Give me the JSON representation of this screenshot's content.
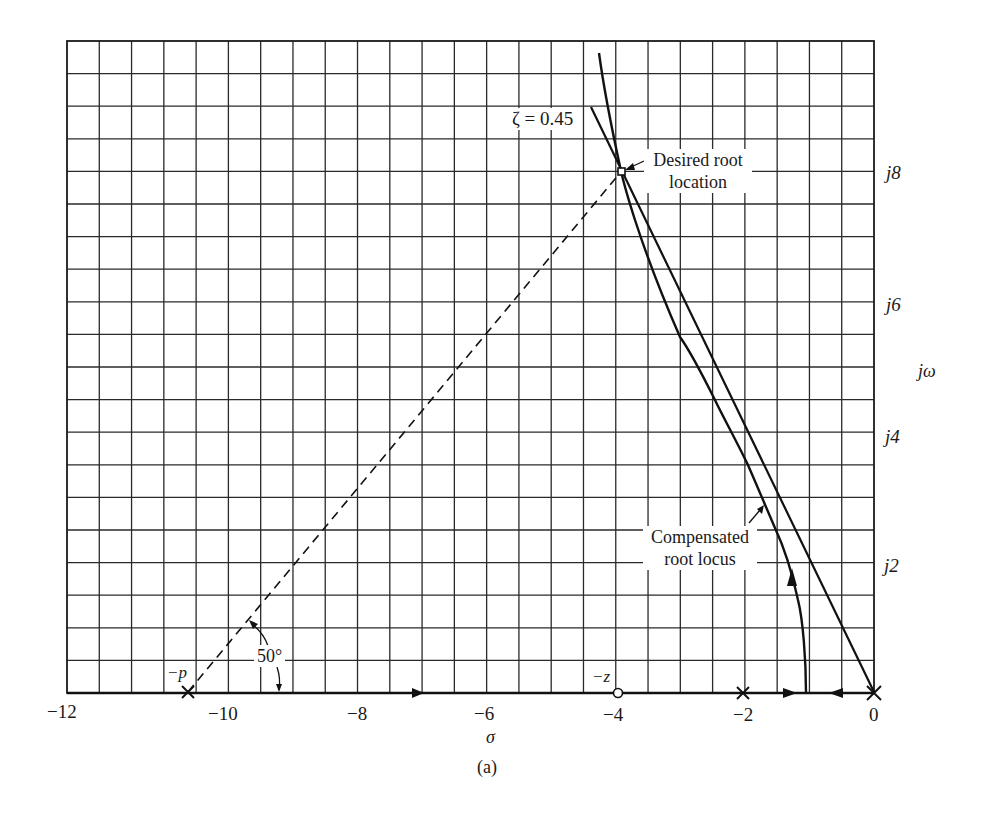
{
  "figure": {
    "caption": "(a)"
  },
  "chart_data": {
    "type": "line",
    "title": "",
    "subtitle": "",
    "caption": "(a)",
    "xlabel": "σ",
    "ylabel": "jω",
    "xlim": [
      -12.5,
      0
    ],
    "ylim": [
      0,
      10
    ],
    "grid": true,
    "grid_spacing": {
      "x": 0.5,
      "y": 0.5
    },
    "x_ticks": [
      "−12",
      "−10",
      "−8",
      "−6",
      "−4",
      "−2",
      "0"
    ],
    "x_tick_values": [
      -12,
      -10,
      -8,
      -6,
      -4,
      -2,
      0
    ],
    "y_ticks": [
      "j2",
      "j4",
      "j6",
      "j8"
    ],
    "y_tick_values": [
      2,
      4,
      6,
      8
    ],
    "series": [
      {
        "name": "Compensated root locus",
        "style": "solid",
        "points": [
          [
            -1.05,
            0
          ],
          [
            -1.15,
            0.95
          ],
          [
            -1.3,
            1.7
          ],
          [
            -1.5,
            2.45
          ],
          [
            -1.65,
            2.8
          ],
          [
            -1.95,
            3.55
          ],
          [
            -2.45,
            4.5
          ],
          [
            -2.95,
            5.5
          ],
          [
            -3.45,
            6.5
          ],
          [
            -3.95,
            8.0
          ],
          [
            -4.3,
            9.8
          ]
        ]
      },
      {
        "name": "ζ = 0.45 line",
        "style": "solid",
        "points": [
          [
            0,
            0
          ],
          [
            -4.3,
            8.9
          ]
        ]
      },
      {
        "name": "50° construction line",
        "style": "dashed",
        "points": [
          [
            -10.6,
            0
          ],
          [
            -3.95,
            8.0
          ]
        ]
      }
    ],
    "markers": [
      {
        "label": "−p",
        "type": "pole",
        "symbol": "×",
        "x": -10.6,
        "y": 0
      },
      {
        "label": "−z",
        "type": "zero",
        "symbol": "○",
        "x": -4.0,
        "y": 0
      },
      {
        "label": "",
        "type": "pole",
        "symbol": "×",
        "x": -2.0,
        "y": 0
      },
      {
        "label": "",
        "type": "pole",
        "symbol": "×",
        "x": 0.0,
        "y": 0
      },
      {
        "label": "Desired root location",
        "type": "target",
        "symbol": "□",
        "x": -3.95,
        "y": 8.0
      }
    ],
    "annotations": [
      {
        "text": "ζ = 0.45",
        "target": "damping line"
      },
      {
        "text": "Desired root location",
        "target": "point (-3.95, j8)"
      },
      {
        "text": "Compensated root locus",
        "target": "locus branch"
      },
      {
        "text": "50°",
        "target": "angle between dashed line and real axis at −p"
      }
    ],
    "legend": null
  },
  "labels": {
    "x_ticks": [
      "−12",
      "−10",
      "−8",
      "−6",
      "−4",
      "−2",
      "0"
    ],
    "y_ticks": [
      "j8",
      "j6",
      "j4",
      "j2"
    ],
    "x_axis": "σ",
    "y_axis": "jω",
    "zeta": "ζ = 0.45",
    "desired_line1": "Desired root",
    "desired_line2": "location",
    "comp_line1": "Compensated",
    "comp_line2": "root locus",
    "angle": "50°",
    "pole_p": "−p",
    "zero_z": "−z"
  }
}
